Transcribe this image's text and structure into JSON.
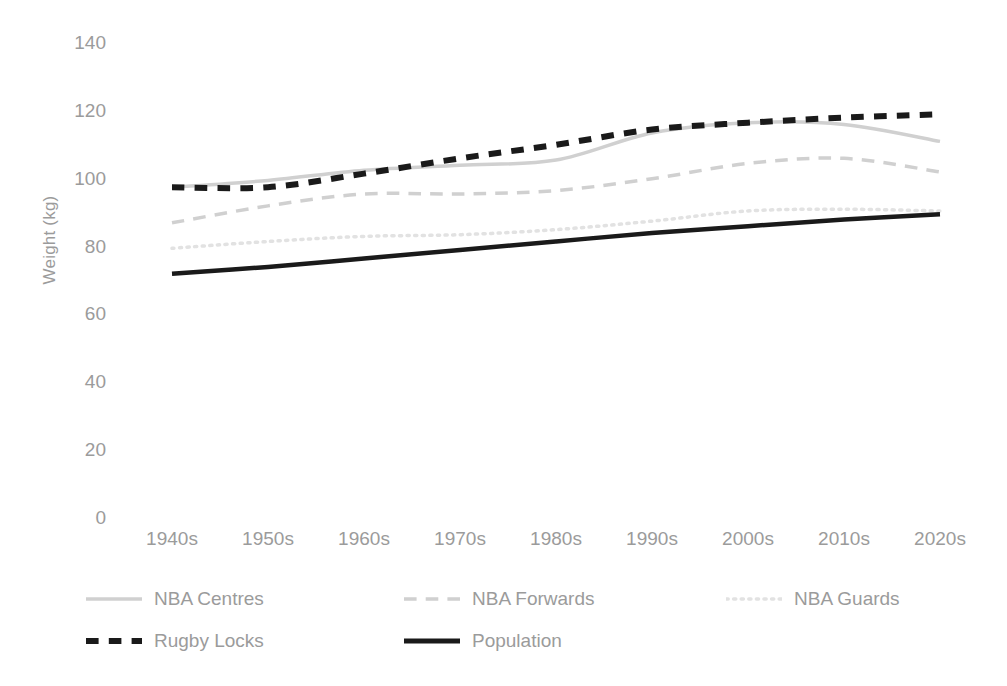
{
  "chart_data": {
    "type": "line",
    "title": "",
    "xlabel": "",
    "ylabel": "Weight (kg)",
    "categories": [
      "1940s",
      "1950s",
      "1960s",
      "1970s",
      "1980s",
      "1990s",
      "2000s",
      "2010s",
      "2020s"
    ],
    "ylim": [
      0,
      140
    ],
    "ytick_step": 20,
    "yticks": [
      "140",
      "120",
      "100",
      "80",
      "60",
      "40",
      "20",
      "0"
    ],
    "grid": false,
    "legend_position": "bottom",
    "series": [
      {
        "name": "NBA Centres",
        "color": "#d0d0d0",
        "style": "solid",
        "width": 3.5,
        "values": [
          97.5,
          99.5,
          102.5,
          104.0,
          105.5,
          113.5,
          116.5,
          116.0,
          111.0
        ]
      },
      {
        "name": "NBA Forwards",
        "color": "#d0d0d0",
        "style": "dashed",
        "width": 3.5,
        "values": [
          87.0,
          92.0,
          95.5,
          95.5,
          96.5,
          100.0,
          104.5,
          106.0,
          102.0
        ]
      },
      {
        "name": "NBA Guards",
        "color": "#e2e2e2",
        "style": "dotted",
        "width": 3.5,
        "values": [
          79.5,
          81.5,
          83.0,
          83.5,
          85.0,
          87.5,
          90.5,
          91.0,
          90.5
        ]
      },
      {
        "name": "Rugby Locks",
        "color": "#1a1a1a",
        "style": "dashed",
        "width": 6.0,
        "values": [
          97.5,
          97.5,
          101.5,
          106.0,
          110.0,
          114.5,
          116.5,
          118.0,
          119.0
        ]
      },
      {
        "name": "Population",
        "color": "#1a1a1a",
        "style": "solid",
        "width": 4.5,
        "values": [
          72.0,
          74.0,
          76.5,
          79.0,
          81.5,
          84.0,
          86.0,
          88.0,
          89.5
        ]
      }
    ]
  },
  "legend": {
    "rows": [
      [
        {
          "label": "NBA Centres",
          "color": "#d0d0d0",
          "style": "solid"
        },
        {
          "label": "NBA Forwards",
          "color": "#d0d0d0",
          "style": "dashed"
        },
        {
          "label": "NBA Guards",
          "color": "#e2e2e2",
          "style": "dotted"
        }
      ],
      [
        {
          "label": "Rugby Locks",
          "color": "#1a1a1a",
          "style": "dashed"
        },
        {
          "label": "Population",
          "color": "#1a1a1a",
          "style": "solid"
        }
      ]
    ]
  }
}
